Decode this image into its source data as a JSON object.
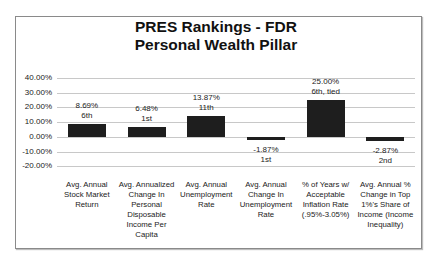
{
  "chart_data": {
    "type": "bar",
    "title": "PRES Rankings - FDR",
    "subtitle": "Personal Wealth Pillar",
    "xlabel": "",
    "ylabel": "",
    "ylim": [
      -0.2,
      0.4
    ],
    "yticks": [
      "40.00%",
      "30.00%",
      "20.00%",
      "10.00%",
      "0.00%",
      "-10.00%",
      "-20.00%"
    ],
    "grid": true,
    "legend": null,
    "categories": [
      "Avg. Annual Stock Market Return",
      "Avg. Annualized Change In Personal Disposable Income Per Capita",
      "Avg. Annual Unemployment Rate",
      "Avg. Annual Change In Unemployment Rate",
      "% of Years w/ Acceptable Inflation Rate (.95%-3.05%)",
      "Avg. Annual % Change in Top 1%'s Share of Income (Income Inequality)"
    ],
    "values": [
      0.0869,
      0.0648,
      0.1387,
      -0.0187,
      0.25,
      -0.0287
    ],
    "data_labels": [
      "8.69%",
      "6.48%",
      "13.87%",
      "-1.87%",
      "25.00%",
      "-2.87%"
    ],
    "rank_labels": [
      "6th",
      "1st",
      "11th",
      "1st",
      "6th, tied",
      "2nd"
    ],
    "bar_color": "#1e1e1e"
  },
  "chart": {
    "title_line1": "PRES Rankings - FDR",
    "title_line2": "Personal Wealth Pillar",
    "yticks": [
      "40.00%",
      "30.00%",
      "20.00%",
      "10.00%",
      "0.00%",
      "-10.00%",
      "-20.00%"
    ],
    "bars": [
      {
        "value": "8.69%",
        "rank": "6th",
        "cat_lines": [
          "Avg. Annual",
          "Stock Market",
          "Return"
        ]
      },
      {
        "value": "6.48%",
        "rank": "1st",
        "cat_lines": [
          "Avg. Annualized",
          "Change In",
          "Personal",
          "Disposable",
          "Income Per",
          "Capita"
        ]
      },
      {
        "value": "13.87%",
        "rank": "11th",
        "cat_lines": [
          "Avg. Annual",
          "Unemployment",
          "Rate"
        ]
      },
      {
        "value": "-1.87%",
        "rank": "1st",
        "cat_lines": [
          "Avg. Annual",
          "Change In",
          "Unemployment",
          "Rate"
        ]
      },
      {
        "value": "25.00%",
        "rank": "6th, tied",
        "cat_lines": [
          "% of Years w/",
          "Acceptable",
          "Inflation Rate",
          "(.95%-3.05%)"
        ]
      },
      {
        "value": "-2.87%",
        "rank": "2nd",
        "cat_lines": [
          "Avg. Annual %",
          "Change in Top",
          "1%'s Share of",
          "Income (Income",
          "Inequality)"
        ]
      }
    ]
  }
}
